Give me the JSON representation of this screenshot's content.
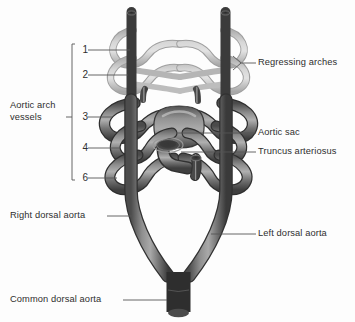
{
  "figure": {
    "background_color": "#fdfdfd",
    "text_color": "#2e2e2e",
    "leader_color": "#555555",
    "vessel_color_active": "#6b6b6b",
    "vessel_color_regressing": "#b9b9b9",
    "vessel_highlight": "#c9c9c9",
    "vessel_shadow": "#3d3d3d"
  },
  "bracket": {
    "label": "Aortic arch\nvessels",
    "top": 44,
    "bottom": 180,
    "x": 72
  },
  "arch_numbers": [
    {
      "label": "1",
      "y": 50
    },
    {
      "label": "2",
      "y": 75
    },
    {
      "label": "3",
      "y": 117
    },
    {
      "label": "4",
      "y": 148
    },
    {
      "label": "6",
      "y": 178
    }
  ],
  "labels": [
    {
      "name": "regressing-arches",
      "text": "Regressing arches",
      "x": 258,
      "y": 58,
      "align": "left"
    },
    {
      "name": "aortic-sac",
      "text": "Aortic sac",
      "x": 258,
      "y": 128,
      "align": "left"
    },
    {
      "name": "truncus-arteriosus",
      "text": "Truncus arteriosus",
      "x": 258,
      "y": 148,
      "align": "left"
    },
    {
      "name": "left-dorsal-aorta",
      "text": "Left dorsal aorta",
      "x": 258,
      "y": 231,
      "align": "left"
    },
    {
      "name": "right-dorsal-aorta",
      "text": "Right dorsal aorta",
      "x": 10,
      "y": 211,
      "align": "left"
    },
    {
      "name": "common-dorsal-aorta",
      "text": "Common dorsal aorta",
      "x": 10,
      "y": 296,
      "align": "left"
    },
    {
      "name": "aortic-arch-vessels",
      "text": "Aortic arch\nvessels",
      "x": 10,
      "y": 106,
      "align": "left"
    }
  ],
  "structures": {
    "dorsal_aortae": "paired vertical dorsal aortae",
    "arch_1": "regressing first aortic arch",
    "arch_2": "regressing second aortic arch",
    "arch_3": "third aortic arch",
    "arch_4": "fourth aortic arch",
    "arch_6": "sixth aortic arch",
    "aortic_sac": "aortic sac at midline",
    "truncus_arteriosus": "cut truncus arteriosus",
    "common_dorsal_aorta": "common dorsal aorta"
  }
}
